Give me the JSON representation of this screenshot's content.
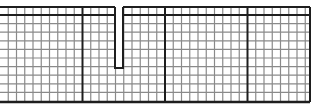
{
  "diagram": {
    "title": "Grid strip with notch",
    "colors": {
      "background": "#ffffff",
      "minor_line": "#8a8a8a",
      "major_line": "#1e1e1e",
      "notch_fill": "#ffffff"
    },
    "grid": {
      "left": 0,
      "top": 7,
      "right": 310,
      "bottom": 102,
      "cell_width": 8.25,
      "row_lines_y": [
        7,
        15,
        23.6,
        32.2,
        40.8,
        49.4,
        58,
        66.6,
        75.2,
        83.8,
        92.4,
        102
      ],
      "major_every_columns": 10,
      "major_row_lines_y": [
        15
      ]
    },
    "notch": {
      "x_left": 115,
      "x_right": 123,
      "y_top": 0,
      "y_bottom": 68
    }
  }
}
